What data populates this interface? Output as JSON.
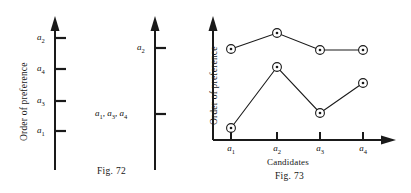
{
  "page": {
    "background": "#ffffff",
    "ink": "#1a1a1a",
    "width": 411,
    "height": 193
  },
  "fig72": {
    "caption": "Fig. 72",
    "axis_title_left": "Order of preference",
    "left_axis": {
      "ticks": [
        {
          "label_html": "a<sub>2</sub>",
          "label": "a2",
          "y": 38
        },
        {
          "label_html": "a<sub>4</sub>",
          "label": "a4",
          "y": 69
        },
        {
          "label_html": "a<sub>3</sub>",
          "label": "a3",
          "y": 101
        },
        {
          "label_html": "a<sub>1</sub>",
          "label": "a1",
          "y": 131
        }
      ]
    },
    "right_axis": {
      "ticks": [
        {
          "label_html": "a<sub>2</sub>",
          "label": "a2",
          "y": 48
        },
        {
          "label_html": "a<sub>1</sub>, a<sub>3</sub>, a<sub>4</sub>",
          "label": "a1, a3, a4",
          "y": 114
        }
      ]
    }
  },
  "fig73": {
    "caption": "Fig. 73",
    "axis_title_left": "Order of preference",
    "axis_title_bottom": "Candidates"
  },
  "chart_data": {
    "type": "line",
    "title": "Fig. 73",
    "xlabel": "Candidates",
    "ylabel": "Order of preference",
    "categories": [
      "a1",
      "a2",
      "a3",
      "a4"
    ],
    "category_labels_html": [
      "a<sub>1</sub>",
      "a<sub>2</sub>",
      "a<sub>3</sub>",
      "a<sub>4</sub>"
    ],
    "grid": false,
    "legend": "none",
    "marker": "circle-with-dot",
    "axis_ranges": {
      "x": [
        0,
        5
      ],
      "y": [
        0,
        10
      ]
    },
    "series": [
      {
        "name": "upper",
        "values": [
          7.1,
          8.6,
          7.0,
          7.0
        ]
      },
      {
        "name": "lower",
        "values": [
          0.6,
          5.9,
          2.3,
          4.6
        ]
      }
    ]
  }
}
